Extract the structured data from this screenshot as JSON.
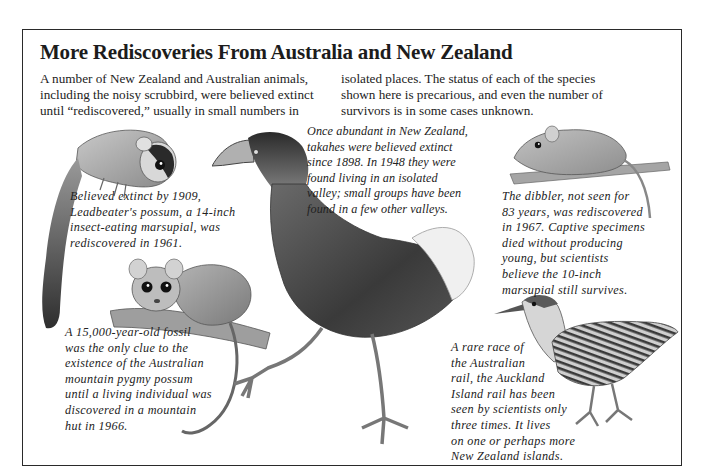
{
  "page": {
    "title": "More Rediscoveries From Australia and New Zealand",
    "intro_left": [
      "A number of New Zealand and Australian animals,",
      "including the noisy scrubbird, were believed extinct",
      "until “rediscovered,” usually in small numbers in"
    ],
    "intro_right": [
      "isolated places. The status of each of the species",
      "shown here is precarious, and even the number of",
      "survivors is in some cases unknown."
    ]
  },
  "captions": {
    "leadbeaters_possum": [
      "Believed extinct by 1909,",
      "Leadbeater's possum, a 14-inch",
      "insect-eating marsupial, was",
      "rediscovered in 1961."
    ],
    "takahe": [
      "Once abundant in New Zealand,",
      "takahes were believed extinct",
      "since 1898. In 1948 they were",
      "found living in an isolated",
      "valley; small groups have been",
      "found in a few other valleys."
    ],
    "dibbler": [
      "The dibbler, not seen for",
      "83 years, was rediscovered",
      "in 1967. Captive specimens",
      "died without producing",
      "young, but scientists",
      "believe the 10-inch",
      "marsupial still survives."
    ],
    "mountain_pygmy_possum": [
      "A 15,000-year-old fossil",
      "was the only clue to the",
      "existence of the Australian",
      "mountain pygmy possum",
      "until a living individual was",
      "discovered in a mountain",
      "hut in 1966."
    ],
    "auckland_island_rail": [
      "A rare race of",
      "the Australian",
      "rail, the Auckland",
      "Island rail has been",
      "seen by scientists only",
      "three times. It lives",
      "on one or perhaps more",
      "New Zealand islands."
    ]
  },
  "illustrations": [
    {
      "name": "leadbeaters-possum",
      "subject": "Leadbeater's possum"
    },
    {
      "name": "mountain-pygmy-possum",
      "subject": "mountain pygmy possum"
    },
    {
      "name": "takahe",
      "subject": "takahe"
    },
    {
      "name": "dibbler",
      "subject": "dibbler"
    },
    {
      "name": "auckland-island-rail",
      "subject": "Auckland Island rail"
    }
  ],
  "colors": {
    "ink": "#1a1a1a",
    "frame": "#2a2a2a",
    "paper": "#ffffff"
  }
}
